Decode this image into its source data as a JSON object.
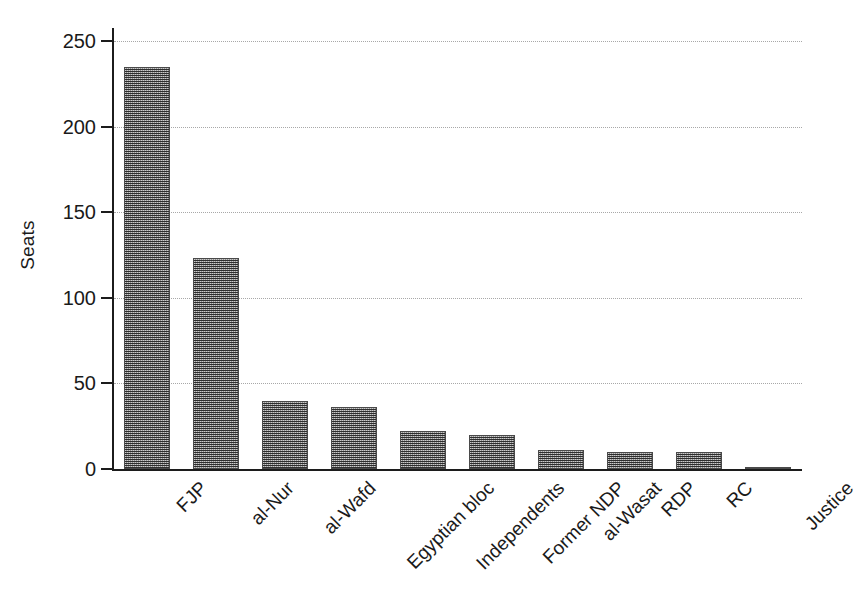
{
  "chart_data": {
    "type": "bar",
    "title": "",
    "xlabel": "",
    "ylabel": "Seats",
    "categories": [
      "FJP",
      "al-Nur",
      "al-Wafd",
      "Egyptian bloc",
      "Independents",
      "Former NDP",
      "al-Wasat",
      "RDP",
      "RC",
      "Justice"
    ],
    "values": [
      235,
      123,
      40,
      36,
      22,
      20,
      11,
      10,
      10,
      1
    ],
    "ylim": [
      0,
      250
    ],
    "yticks": [
      0,
      50,
      100,
      150,
      200,
      250
    ],
    "ytick_labels": [
      "0",
      "50",
      "100",
      "150",
      "200",
      "250"
    ],
    "grid": "horizontal-dotted",
    "legend": "none",
    "bar_fill": "#8c8c8c",
    "bar_edge": "#4a4a4a",
    "axis_color": "#1c1c1c",
    "grid_color": "#a8a8a8",
    "background": "#ffffff",
    "xtick_label_rotation": -45
  }
}
